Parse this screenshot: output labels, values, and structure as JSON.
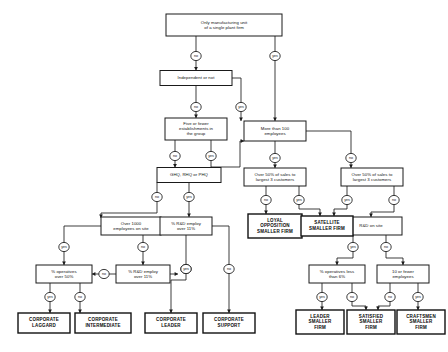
{
  "diagram": {
    "type": "decision-tree-flowchart",
    "title": "",
    "edge_labels": {
      "yes": "yes",
      "no": "no"
    },
    "decision_nodes": [
      {
        "id": "d_single_plant",
        "label": "Only manufacturing unit\nof a single plant firm",
        "x": 224,
        "y": 25,
        "w": 116,
        "h": 22
      },
      {
        "id": "d_independent",
        "label": "Independent or not",
        "x": 196,
        "y": 78,
        "w": 72,
        "h": 15
      },
      {
        "id": "d_five_or_fewer",
        "label": "Five or fewer\nestablishments in\nthe group",
        "x": 196,
        "y": 129,
        "w": 62,
        "h": 22
      },
      {
        "id": "d_more_than_100",
        "label": "More than 100\nemployees",
        "x": 275,
        "y": 131,
        "w": 62,
        "h": 20
      },
      {
        "id": "d_hq",
        "label": "GHQ, RHQ or PHQ",
        "x": 189,
        "y": 175,
        "w": 64,
        "h": 15
      },
      {
        "id": "d_sales_left",
        "label": "Over 50% of sales to\nlargest 3 customers",
        "x": 275,
        "y": 177,
        "w": 62,
        "h": 18
      },
      {
        "id": "d_sales_right",
        "label": "Over 50% of sales to\nlargest 3 customers",
        "x": 372,
        "y": 177,
        "w": 62,
        "h": 18
      },
      {
        "id": "d_over_1000",
        "label": "Over 1000\nemployees on site",
        "x": 131,
        "y": 226,
        "w": 60,
        "h": 18
      },
      {
        "id": "d_rd_employ_a",
        "label": "% R&D employ\nover 11%",
        "x": 186,
        "y": 226,
        "w": 52,
        "h": 18
      },
      {
        "id": "d_rd_on_site",
        "label": "R&D on site",
        "x": 371,
        "y": 226,
        "w": 62,
        "h": 18
      },
      {
        "id": "d_operatives_50",
        "label": "% operatives\nover 50%",
        "x": 64,
        "y": 274,
        "w": 56,
        "h": 18
      },
      {
        "id": "d_rd_employ_b",
        "label": "% R&D employ\nover 11%",
        "x": 143,
        "y": 274,
        "w": 54,
        "h": 18
      },
      {
        "id": "d_operatives_6",
        "label": "% operatives less\nthan 6%",
        "x": 337,
        "y": 274,
        "w": 56,
        "h": 18
      },
      {
        "id": "d_ten_or_fewer",
        "label": "10 or fewer\nemployees",
        "x": 403,
        "y": 274,
        "w": 52,
        "h": 18
      }
    ],
    "terminal_nodes": [
      {
        "id": "t_corporate_laggard",
        "label": "CORPORATE\nLAGGARD",
        "x": 44,
        "y": 323,
        "w": 52,
        "h": 20
      },
      {
        "id": "t_corporate_intermediate",
        "label": "CORPORATE\nINTERMEDIATE",
        "x": 103,
        "y": 323,
        "w": 56,
        "h": 20
      },
      {
        "id": "t_corporate_leader",
        "label": "CORPORATE\nLEADER",
        "x": 171,
        "y": 323,
        "w": 52,
        "h": 20
      },
      {
        "id": "t_corporate_support",
        "label": "CORPORATE\nSUPPORT",
        "x": 229,
        "y": 323,
        "w": 52,
        "h": 20
      },
      {
        "id": "t_loyal_opposition",
        "label": "LOYAL\nOPPOSITION\nSMALLER FIRM",
        "x": 275,
        "y": 226,
        "w": 54,
        "h": 24
      },
      {
        "id": "t_satellite",
        "label": "SATELLITE\nSMALLER FIRM",
        "x": 327,
        "y": 226,
        "w": 52,
        "h": 20
      },
      {
        "id": "t_leader_smaller",
        "label": "LEADER\nSMALLER\nFIRM",
        "x": 320,
        "y": 322,
        "w": 48,
        "h": 24
      },
      {
        "id": "t_satisfied_smaller",
        "label": "SATISFIED\nSMALLER\nFIRM",
        "x": 371,
        "y": 322,
        "w": 48,
        "h": 24
      },
      {
        "id": "t_craftsmen_smaller",
        "label": "CRAFTSMEN\nSMALLER\nFIRM",
        "x": 421,
        "y": 322,
        "w": 48,
        "h": 24
      }
    ],
    "edges": [
      {
        "from": "d_single_plant",
        "to": "d_independent",
        "label": "no",
        "path": "M 196 36 L 196 52 M 196 60 L 196 70.5",
        "circle": {
          "x": 196,
          "y": 56
        },
        "arrow": {
          "x": 196,
          "y": 70.5
        }
      },
      {
        "from": "d_single_plant",
        "to": "d_more_than_100",
        "label": "yes",
        "path": "M 275 36 L 275 52 M 275 60 L 275 121",
        "circle": {
          "x": 275,
          "y": 56
        },
        "arrow": {
          "x": 275,
          "y": 121
        }
      },
      {
        "from": "d_independent",
        "to": "d_five_or_fewer",
        "label": "no",
        "path": "M 196 85.5 L 196 103 M 196 111 L 196 118",
        "circle": {
          "x": 196,
          "y": 107
        },
        "arrow": {
          "x": 196,
          "y": 118
        }
      },
      {
        "from": "d_independent",
        "to": "d_more_than_100",
        "label": "yes",
        "path": "M 232 78 L 241 78 L 241 103 M 241 111 L 241 118 L 241 121",
        "circle": {
          "x": 241,
          "y": 107
        },
        "arrow": {
          "x": 241,
          "y": 121
        }
      },
      {
        "from": "d_five_or_fewer",
        "to": "d_hq",
        "label": "no",
        "path": "M 175 140 L 175 152 M 175 160 L 175 167.5",
        "circle": {
          "x": 175,
          "y": 156
        },
        "arrow": {
          "x": 175,
          "y": 167.5
        }
      },
      {
        "from": "d_five_or_fewer",
        "to": "d_more_than_100",
        "label": "yes",
        "path": "M 211 140 L 211 152 M 211 160 L 211 167 L 240 167 L 240 141 L 244 141",
        "circle": {
          "x": 211,
          "y": 156
        },
        "arrow": {
          "x": 244,
          "y": 141
        }
      },
      {
        "from": "d_more_than_100",
        "to": "d_sales_left",
        "label": "yes",
        "path": "M 275 141 L 275 154 M 275 162 L 275 168",
        "circle": {
          "x": 275,
          "y": 158
        },
        "arrow": {
          "x": 275,
          "y": 168
        }
      },
      {
        "from": "d_more_than_100",
        "to": "d_sales_right",
        "label": "no",
        "path": "M 306 131 L 351 131 L 351 154 M 351 162 L 351 168",
        "circle": {
          "x": 351,
          "y": 158
        },
        "arrow": {
          "x": 351,
          "y": 168
        }
      },
      {
        "from": "d_hq",
        "to": "d_over_1000",
        "label": "no",
        "path": "M 157 182.5 L 157 193 M 157 201 L 157 213 L 101 213 L 101 218",
        "circle": {
          "x": 157,
          "y": 197
        },
        "arrow": {
          "x": 101,
          "y": 218
        }
      },
      {
        "from": "d_hq",
        "to": "d_rd_employ_a",
        "label": "yes",
        "path": "M 189 182.5 L 189 193 M 189 201 L 189 217",
        "circle": {
          "x": 189,
          "y": 197
        },
        "arrow": {
          "x": 189,
          "y": 217
        }
      },
      {
        "from": "d_sales_left",
        "to": "t_loyal_opposition",
        "label": "no",
        "path": "M 266 186 L 266 196 M 266 204 L 266 214",
        "circle": {
          "x": 266,
          "y": 200
        },
        "arrow": {
          "x": 266,
          "y": 214
        }
      },
      {
        "from": "d_sales_left",
        "to": "t_satellite",
        "label": "yes",
        "path": "M 299 186 L 299 196 M 299 204 L 299 209 L 320 209 L 320 216",
        "circle": {
          "x": 299,
          "y": 200
        },
        "arrow": {
          "x": 320,
          "y": 216
        }
      },
      {
        "from": "d_sales_right",
        "to": "t_satellite",
        "label": "yes",
        "path": "M 347 186 L 347 196 M 347 204 L 347 209 L 334 209 L 334 216",
        "circle": {
          "x": 347,
          "y": 200
        },
        "arrow": {
          "x": 334,
          "y": 216
        }
      },
      {
        "from": "d_sales_right",
        "to": "d_rd_on_site",
        "label": "no",
        "path": "M 394 186 L 394 196 M 394 204 L 394 212 L 371 212 L 371 217",
        "circle": {
          "x": 394,
          "y": 200
        },
        "arrow": {
          "x": 371,
          "y": 217
        }
      },
      {
        "from": "d_over_1000",
        "to": "d_operatives_50",
        "label": "yes",
        "path": "M 101 226 L 64 226 L 64 243 M 64 251 L 64 265",
        "circle": {
          "x": 64,
          "y": 247
        },
        "arrow": {
          "x": 64,
          "y": 265
        }
      },
      {
        "from": "d_over_1000",
        "to": "d_rd_employ_b",
        "label": "no",
        "path": "M 143 235 L 143 243 M 143 251 L 143 265",
        "circle": {
          "x": 143,
          "y": 247
        },
        "arrow": {
          "x": 143,
          "y": 265
        }
      },
      {
        "from": "d_rd_employ_a",
        "to": "t_corporate_leader",
        "label": "yes",
        "path": "M 186 235 L 186 265 M 186 273 L 186 280 L 171 280 L 171 313",
        "circle": {
          "x": 186,
          "y": 269
        },
        "arrow": {
          "x": 171,
          "y": 313
        }
      },
      {
        "from": "d_rd_employ_a",
        "to": "t_corporate_support",
        "label": "no",
        "path": "M 212 226 L 229 226 L 229 265 M 229 273 L 229 313",
        "circle": {
          "x": 229,
          "y": 269
        },
        "arrow": {
          "x": 229,
          "y": 313
        }
      },
      {
        "from": "d_rd_employ_b",
        "to": "d_operatives_50",
        "label": "no",
        "path": "M 116 274 L 108 274 M 100 274 L 92 274",
        "circle": {
          "x": 104,
          "y": 274
        },
        "arrow": {
          "x": 92,
          "y": 274
        }
      },
      {
        "from": "d_rd_employ_b",
        "to": "t_corporate_leader",
        "label": "yes",
        "path": "M 170 274 L 178 274",
        "circle": {
          "x": 186,
          "y": 269
        },
        "arrow": {
          "x": 178,
          "y": 274
        }
      },
      {
        "from": "d_operatives_50",
        "to": "t_corporate_laggard",
        "label": "yes",
        "path": "M 50 283 L 50 293 M 50 301 L 50 313",
        "circle": {
          "x": 50,
          "y": 297
        },
        "arrow": {
          "x": 50,
          "y": 313
        }
      },
      {
        "from": "d_operatives_50",
        "to": "t_corporate_intermediate",
        "label": "no",
        "path": "M 80 283 L 80 293 M 80 301 L 80 313",
        "circle": {
          "x": 80,
          "y": 297
        },
        "arrow": {
          "x": 80,
          "y": 313
        }
      },
      {
        "from": "d_rd_on_site",
        "to": "d_operatives_6",
        "label": "yes",
        "path": "M 353 235 L 353 243 M 353 251 L 353 258 L 337 258 L 337 265",
        "circle": {
          "x": 353,
          "y": 247
        },
        "arrow": {
          "x": 337,
          "y": 265
        }
      },
      {
        "from": "d_rd_on_site",
        "to": "d_ten_or_fewer",
        "label": "no",
        "path": "M 386 235 L 386 243 M 386 251 L 386 258 L 403 258 L 403 265",
        "circle": {
          "x": 386,
          "y": 247
        },
        "arrow": {
          "x": 403,
          "y": 265
        }
      },
      {
        "from": "d_operatives_6",
        "to": "t_leader_smaller",
        "label": "yes",
        "path": "M 322 283 L 322 293 M 322 301 L 322 310",
        "circle": {
          "x": 322,
          "y": 297
        },
        "arrow": {
          "x": 322,
          "y": 310
        }
      },
      {
        "from": "d_operatives_6",
        "to": "t_satisfied_smaller",
        "label": "no",
        "path": "M 352 283 L 352 293 M 352 301 L 352 306 L 366 306 L 366 310",
        "circle": {
          "x": 352,
          "y": 297
        },
        "arrow": {
          "x": 366,
          "y": 310
        }
      },
      {
        "from": "d_ten_or_fewer",
        "to": "t_satisfied_smaller",
        "label": "no",
        "path": "M 390 283 L 390 293 M 390 301 L 390 306 L 378 306 L 378 310",
        "circle": {
          "x": 390,
          "y": 297
        },
        "arrow": {
          "x": 378,
          "y": 310
        }
      },
      {
        "from": "d_ten_or_fewer",
        "to": "t_craftsmen_smaller",
        "label": "yes",
        "path": "M 418 283 L 418 293 M 418 301 L 418 310",
        "circle": {
          "x": 418,
          "y": 297
        },
        "arrow": {
          "x": 418,
          "y": 310
        }
      }
    ]
  }
}
